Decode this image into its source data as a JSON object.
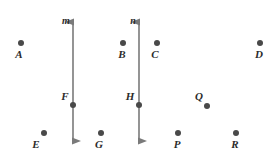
{
  "figure": {
    "width": 277,
    "height": 156,
    "background_color": "#ffffff",
    "line_color": "#7a7a7a",
    "dot_color": "#494949",
    "label_color": "#2b2b2b"
  },
  "lines": [
    {
      "id": "line-m",
      "label": "m",
      "x": 73,
      "y_top": 13,
      "y_bottom": 150,
      "label_x": 66,
      "label_y": 21,
      "arrow_top": true,
      "arrow_bottom": true
    },
    {
      "id": "line-n",
      "label": "n",
      "x": 139,
      "y_top": 13,
      "y_bottom": 150,
      "label_x": 133,
      "label_y": 21,
      "arrow_top": true,
      "arrow_bottom": true
    }
  ],
  "points": [
    {
      "id": "point-a",
      "label": "A",
      "dot_x": 21,
      "dot_y": 43,
      "label_x": 19,
      "label_y": 54,
      "on_line": ""
    },
    {
      "id": "point-b",
      "label": "B",
      "dot_x": 123,
      "dot_y": 43,
      "label_x": 122,
      "label_y": 54,
      "on_line": ""
    },
    {
      "id": "point-c",
      "label": "C",
      "dot_x": 157,
      "dot_y": 43,
      "label_x": 155,
      "label_y": 54,
      "on_line": ""
    },
    {
      "id": "point-d",
      "label": "D",
      "dot_x": 260,
      "dot_y": 43,
      "label_x": 259,
      "label_y": 54,
      "on_line": ""
    },
    {
      "id": "point-f",
      "label": "F",
      "dot_x": 73,
      "dot_y": 105,
      "label_x": 65,
      "label_y": 96,
      "on_line": "m"
    },
    {
      "id": "point-h",
      "label": "H",
      "dot_x": 139,
      "dot_y": 105,
      "label_x": 130,
      "label_y": 96,
      "on_line": "n"
    },
    {
      "id": "point-q",
      "label": "Q",
      "dot_x": 207,
      "dot_y": 106,
      "label_x": 199,
      "label_y": 96,
      "on_line": ""
    },
    {
      "id": "point-e",
      "label": "E",
      "dot_x": 44,
      "dot_y": 133,
      "label_x": 36,
      "label_y": 144,
      "on_line": ""
    },
    {
      "id": "point-g",
      "label": "G",
      "dot_x": 101,
      "dot_y": 133,
      "label_x": 99,
      "label_y": 144,
      "on_line": ""
    },
    {
      "id": "point-p",
      "label": "P",
      "dot_x": 178,
      "dot_y": 133,
      "label_x": 177,
      "label_y": 144,
      "on_line": ""
    },
    {
      "id": "point-r",
      "label": "R",
      "dot_x": 236,
      "dot_y": 133,
      "label_x": 235,
      "label_y": 144,
      "on_line": ""
    }
  ]
}
